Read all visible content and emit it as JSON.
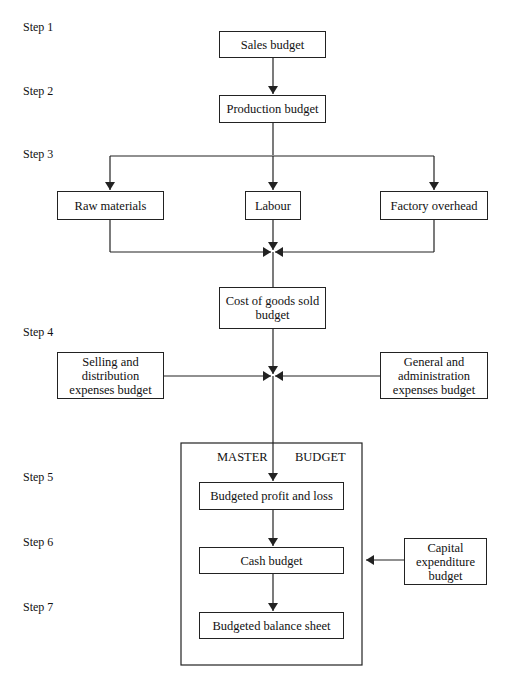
{
  "steps": [
    "Step 1",
    "Step 2",
    "Step 3",
    "Step 4",
    "Step 5",
    "Step 6",
    "Step 7"
  ],
  "nodes": {
    "sales": "Sales budget",
    "production": "Production budget",
    "raw": "Raw  materials",
    "labour": "Labour",
    "factory": "Factory overhead",
    "cogs": "Cost of goods sold\nbudget",
    "selling": "Selling and\ndistribution\nexpenses budget",
    "general": "General and\nadministration\nexpenses budget",
    "pl": "Budgeted profit and loss",
    "cash": "Cash budget",
    "balance": "Budgeted balance sheet",
    "capex": "Capital\nexpenditure\nbudget"
  },
  "master": {
    "left": "MASTER",
    "right": "BUDGET"
  },
  "colors": {
    "line": "#222222",
    "background": "#ffffff"
  }
}
